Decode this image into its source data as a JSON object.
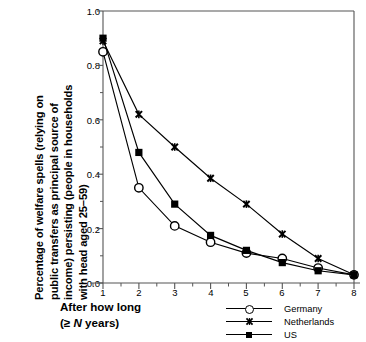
{
  "chart_data": {
    "type": "line",
    "title": "",
    "xlabel": "After how long (≥ N years)",
    "ylabel": "Percentage of welfare spells (relying on public transfers as principal source of income) persisting (people in households with head aged 25–59)",
    "x": [
      1,
      2,
      3,
      4,
      5,
      6,
      7,
      8
    ],
    "xlim": [
      1,
      8
    ],
    "ylim": [
      0.0,
      1.0
    ],
    "xticks": [
      "1",
      "2",
      "3",
      "4",
      "5",
      "6",
      "7",
      "8"
    ],
    "yticks": [
      "0.0",
      "0.2",
      "0.4",
      "0.6",
      "0.8",
      "1.0"
    ],
    "yminor_step": 0.1,
    "grid": false,
    "legend_position": "bottom-right",
    "series": [
      {
        "name": "Germany",
        "marker": "open-circle",
        "values": [
          0.85,
          0.35,
          0.21,
          0.15,
          0.11,
          0.09,
          0.055,
          0.03
        ]
      },
      {
        "name": "Netherlands",
        "marker": "x-cross",
        "values": [
          0.89,
          0.62,
          0.5,
          0.385,
          0.29,
          0.18,
          0.09,
          0.03
        ]
      },
      {
        "name": "US",
        "marker": "filled-square",
        "values": [
          0.9,
          0.48,
          0.29,
          0.175,
          0.12,
          0.075,
          0.045,
          0.03
        ]
      }
    ]
  },
  "axis": {
    "y_title_lines": "Percentage of welfare spells (relying on\npublic transfers as principal source of\nincome) persisting (people in households\nwith head aged 25–59)",
    "x_caption_line1": "After how long",
    "x_caption_line2_pre": "(≥ ",
    "x_caption_line2_ital": "N",
    "x_caption_line2_post": " years)"
  },
  "legend": {
    "items": [
      {
        "label": "Germany"
      },
      {
        "label": "Netherlands"
      },
      {
        "label": "US"
      }
    ]
  },
  "colors": {
    "line": "#000000",
    "background": "#ffffff",
    "axis": "#4d4d4d"
  }
}
